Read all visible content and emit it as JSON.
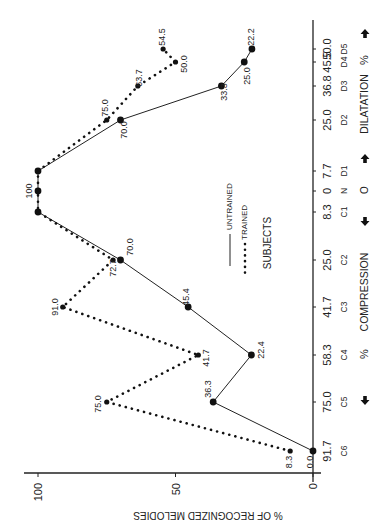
{
  "chart_data": {
    "type": "line",
    "orientation_note": "figure displayed rotated 90 degrees counterclockwise",
    "title": "",
    "xlabel": "COMPRESSION / DILATATION %",
    "ylabel": "% OF RECOGNIZED MELODIES",
    "ylim": [
      0,
      100
    ],
    "yticks": [
      0,
      50,
      100
    ],
    "categories": [
      "C6",
      "C5",
      "C4",
      "C3",
      "C2",
      "C1",
      "N",
      "D1",
      "D2",
      "D3",
      "D4",
      "D5"
    ],
    "category_percent": [
      "91.7",
      "75.0",
      "58.3",
      "41.7",
      "25.0",
      "8.3",
      "0",
      "7.7",
      "25.0",
      "36.8",
      "45.5",
      "50.0"
    ],
    "series": [
      {
        "name": "UNTRAINED",
        "style": "solid",
        "values": [
          0.0,
          36.3,
          22.4,
          45.4,
          70.0,
          100,
          100,
          100,
          70.0,
          33.3,
          25.0,
          22.2
        ],
        "labels": [
          "0.0",
          "36.3",
          "22.4",
          "45.4",
          "70.0",
          "",
          "100",
          "",
          "70.0",
          "33.3",
          "25.0",
          "22.2"
        ]
      },
      {
        "name": "TRAINED",
        "style": "dotted",
        "values": [
          8.3,
          75.0,
          41.7,
          91.0,
          72.7,
          100,
          100,
          100,
          75.0,
          63.7,
          50.0,
          54.5
        ],
        "labels": [
          "8.3",
          "75.0",
          "41.7",
          "91.0",
          "72.7",
          "",
          "",
          "",
          "75.0",
          "63.7",
          "50.0",
          "54.5"
        ]
      }
    ],
    "legend": {
      "title": "SUBJECTS",
      "entries": [
        "UNTRAINED",
        "TRAINED"
      ]
    },
    "direction_labels": {
      "compression": "COMPRESSION",
      "dilatation": "DILATATION",
      "percent": "%",
      "origin": "O"
    },
    "grid": false
  }
}
